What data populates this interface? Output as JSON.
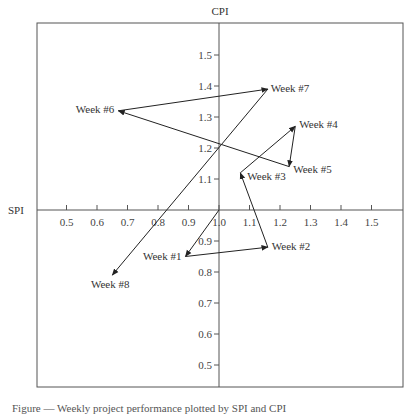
{
  "chart_data": {
    "type": "scatter",
    "title": "",
    "xlabel": "SPI",
    "ylabel": "CPI",
    "xlim": [
      0.4,
      1.6
    ],
    "ylim": [
      0.4,
      1.6
    ],
    "grid": false,
    "legend": null,
    "axes_cross_at": [
      1.0,
      1.0
    ],
    "x_ticks": [
      "0.5",
      "0.6",
      "0.7",
      "0.8",
      "0.9",
      "1.0",
      "1.1",
      "1.2",
      "1.3",
      "1.4",
      "1.5"
    ],
    "y_ticks": [
      "0.5",
      "0.6",
      "0.7",
      "0.8",
      "0.9",
      "1.1",
      "1.2",
      "1.3",
      "1.4",
      "1.5"
    ],
    "path_start": {
      "x": 1.0,
      "y": 1.0
    },
    "connected_with_arrows": true,
    "points": [
      {
        "label": "Week #1",
        "x": 0.89,
        "y": 0.85
      },
      {
        "label": "Week #2",
        "x": 1.16,
        "y": 0.88
      },
      {
        "label": "Week #3",
        "x": 1.07,
        "y": 1.12
      },
      {
        "label": "Week #4",
        "x": 1.25,
        "y": 1.27
      },
      {
        "label": "Week #5",
        "x": 1.23,
        "y": 1.14
      },
      {
        "label": "Week #6",
        "x": 0.67,
        "y": 1.32
      },
      {
        "label": "Week #7",
        "x": 1.16,
        "y": 1.39
      },
      {
        "label": "Week #8",
        "x": 0.65,
        "y": 0.79
      }
    ]
  },
  "caption": "Figure — Weekly project performance plotted by SPI and CPI"
}
